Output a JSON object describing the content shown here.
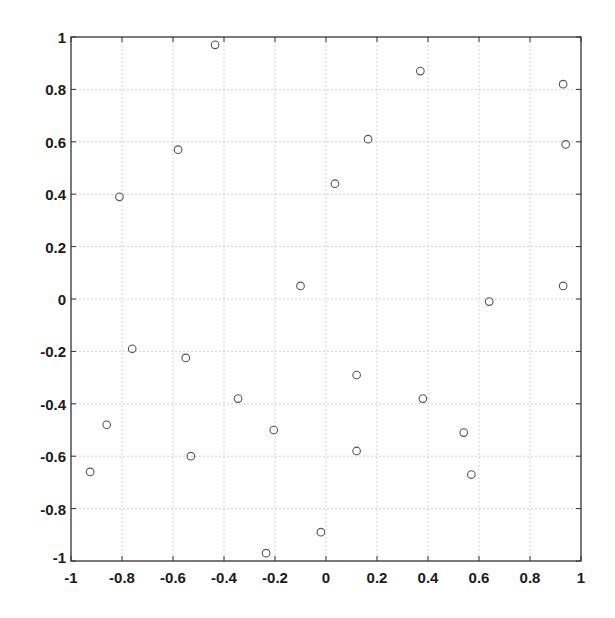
{
  "chart_data": {
    "type": "scatter",
    "title": "",
    "xlabel": "",
    "ylabel": "",
    "xlim": [
      -1,
      1
    ],
    "ylim": [
      -1,
      1
    ],
    "grid": true,
    "legend": null,
    "marker": "open-circle",
    "xticks": [
      -1,
      -0.8,
      -0.6,
      -0.4,
      -0.2,
      0,
      0.2,
      0.4,
      0.6,
      0.8,
      1
    ],
    "yticks": [
      -1,
      -0.8,
      -0.6,
      -0.4,
      -0.2,
      0,
      0.2,
      0.4,
      0.6,
      0.8,
      1
    ],
    "xtick_labels": [
      "-1",
      "-0.8",
      "-0.6",
      "-0.4",
      "-0.2",
      "0",
      "0.2",
      "0.4",
      "0.6",
      "0.8",
      "1"
    ],
    "ytick_labels": [
      "-1",
      "-0.8",
      "-0.6",
      "-0.4",
      "-0.2",
      "0",
      "0.2",
      "0.4",
      "0.6",
      "0.8",
      "1"
    ],
    "series": [
      {
        "name": "points",
        "points": [
          {
            "x": -0.435,
            "y": 0.97
          },
          {
            "x": 0.37,
            "y": 0.87
          },
          {
            "x": 0.93,
            "y": 0.82
          },
          {
            "x": 0.165,
            "y": 0.61
          },
          {
            "x": 0.94,
            "y": 0.59
          },
          {
            "x": -0.58,
            "y": 0.57
          },
          {
            "x": 0.035,
            "y": 0.44
          },
          {
            "x": -0.81,
            "y": 0.39
          },
          {
            "x": -0.1,
            "y": 0.05
          },
          {
            "x": 0.93,
            "y": 0.05
          },
          {
            "x": 0.64,
            "y": -0.01
          },
          {
            "x": -0.76,
            "y": -0.19
          },
          {
            "x": -0.55,
            "y": -0.225
          },
          {
            "x": 0.12,
            "y": -0.29
          },
          {
            "x": -0.345,
            "y": -0.38
          },
          {
            "x": 0.38,
            "y": -0.38
          },
          {
            "x": -0.86,
            "y": -0.48
          },
          {
            "x": -0.205,
            "y": -0.5
          },
          {
            "x": 0.54,
            "y": -0.51
          },
          {
            "x": 0.12,
            "y": -0.58
          },
          {
            "x": -0.53,
            "y": -0.6
          },
          {
            "x": -0.925,
            "y": -0.66
          },
          {
            "x": 0.57,
            "y": -0.67
          },
          {
            "x": -0.02,
            "y": -0.89
          },
          {
            "x": -0.235,
            "y": -0.97
          }
        ]
      }
    ]
  },
  "colors": {
    "axis": "#333333",
    "grid": "#c8c8c8",
    "marker": "#555555"
  }
}
